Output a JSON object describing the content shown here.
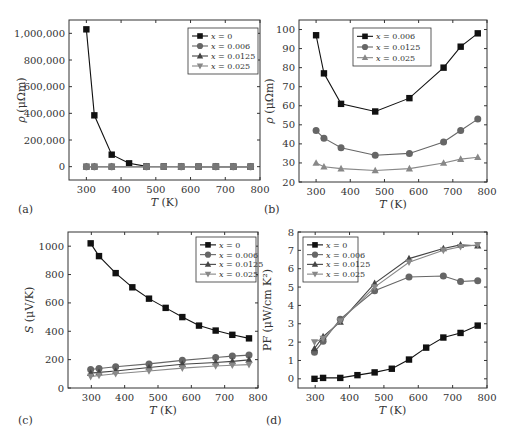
{
  "figure": {
    "panel_labels": [
      "(a)",
      "(b)",
      "(c)",
      "(d)"
    ]
  },
  "colors": {
    "x0": "#111111",
    "x006": "#666666",
    "x0125": "#444444",
    "x025": "#888888",
    "axis": "#333333"
  },
  "chart_data": [
    {
      "panel": "(a)",
      "type": "line",
      "xlabel": "T (K)",
      "ylabel": "ρ (μΩm)",
      "xlim": [
        250,
        800
      ],
      "ylim": [
        -100000,
        1100000
      ],
      "xticks": [
        300,
        400,
        500,
        600,
        700,
        800
      ],
      "yticks": [
        0,
        200000,
        400000,
        600000,
        800000,
        1000000
      ],
      "ytick_labels": [
        "0",
        "200,000",
        "400,000",
        "600,000",
        "800,000",
        "1,000,000"
      ],
      "legend_position": "upper right",
      "series": [
        {
          "name": "x = 0",
          "marker": "square",
          "x": [
            300,
            323,
            373,
            423,
            473,
            523,
            573,
            623,
            673,
            723,
            773
          ],
          "values": [
            1030000,
            385000,
            90000,
            25000,
            2000,
            1000,
            800,
            600,
            500,
            400,
            300
          ]
        },
        {
          "name": "x = 0.006",
          "marker": "circle",
          "x": [
            300,
            323,
            373,
            473,
            573,
            673,
            723,
            773
          ],
          "values": [
            97,
            77,
            61,
            57,
            64,
            80,
            91,
            98
          ]
        },
        {
          "name": "x = 0.0125",
          "marker": "triangle-up",
          "x": [
            300,
            323,
            373,
            473,
            573,
            673,
            723,
            773
          ],
          "values": [
            47,
            43,
            38,
            34,
            35,
            41,
            47,
            53
          ]
        },
        {
          "name": "x = 0.025",
          "marker": "triangle-down",
          "x": [
            300,
            323,
            373,
            473,
            573,
            673,
            723,
            773
          ],
          "values": [
            30,
            28,
            27,
            26,
            27,
            30,
            32,
            33
          ]
        }
      ]
    },
    {
      "panel": "(b)",
      "type": "line",
      "xlabel": "T (K)",
      "ylabel": "ρ (μΩm)",
      "xlim": [
        250,
        800
      ],
      "ylim": [
        20,
        105
      ],
      "xticks": [
        300,
        400,
        500,
        600,
        700,
        800
      ],
      "yticks": [
        20,
        30,
        40,
        50,
        60,
        70,
        80,
        90,
        100
      ],
      "legend_position": "upper center",
      "series": [
        {
          "name": "x = 0.006",
          "marker": "square",
          "x": [
            300,
            323,
            373,
            473,
            573,
            673,
            723,
            773
          ],
          "values": [
            97,
            77,
            61,
            57,
            64,
            80,
            91,
            98
          ]
        },
        {
          "name": "x = 0.0125",
          "marker": "circle",
          "x": [
            300,
            323,
            373,
            473,
            573,
            673,
            723,
            773
          ],
          "values": [
            47,
            43,
            38,
            34,
            35,
            41,
            47,
            53
          ]
        },
        {
          "name": "x = 0.025",
          "marker": "triangle-up",
          "x": [
            300,
            323,
            373,
            473,
            573,
            673,
            723,
            773
          ],
          "values": [
            30,
            28,
            27,
            26,
            27,
            30,
            32,
            33
          ]
        }
      ]
    },
    {
      "panel": "(c)",
      "type": "line",
      "xlabel": "T (K)",
      "ylabel": "S (μV/K)",
      "xlim": [
        230,
        800
      ],
      "ylim": [
        0,
        1100
      ],
      "xticks": [
        300,
        400,
        500,
        600,
        700,
        800
      ],
      "yticks": [
        0,
        200,
        400,
        600,
        800,
        1000
      ],
      "legend_position": "upper right",
      "series": [
        {
          "name": "x = 0",
          "marker": "square",
          "x": [
            298,
            323,
            373,
            423,
            473,
            523,
            573,
            623,
            673,
            723,
            773
          ],
          "values": [
            1020,
            930,
            810,
            710,
            630,
            565,
            500,
            440,
            405,
            375,
            350
          ]
        },
        {
          "name": "x = 0.006",
          "marker": "circle",
          "x": [
            298,
            323,
            373,
            473,
            573,
            673,
            723,
            773
          ],
          "values": [
            130,
            138,
            150,
            170,
            195,
            215,
            225,
            232
          ]
        },
        {
          "name": "x = 0.0125",
          "marker": "triangle-up",
          "x": [
            298,
            323,
            373,
            473,
            573,
            673,
            723,
            773
          ],
          "values": [
            105,
            110,
            120,
            145,
            168,
            180,
            188,
            198
          ]
        },
        {
          "name": "x = 0.025",
          "marker": "triangle-down",
          "x": [
            298,
            323,
            373,
            473,
            573,
            673,
            723,
            773
          ],
          "values": [
            80,
            88,
            100,
            120,
            140,
            155,
            160,
            165
          ]
        }
      ]
    },
    {
      "panel": "(d)",
      "type": "line",
      "xlabel": "T (K)",
      "ylabel": "PF (μW/cm K²)",
      "xlim": [
        250,
        800
      ],
      "ylim": [
        -0.5,
        8
      ],
      "xticks": [
        300,
        400,
        500,
        600,
        700,
        800
      ],
      "yticks": [
        0,
        1,
        2,
        3,
        4,
        5,
        6,
        7,
        8
      ],
      "legend_position": "upper left",
      "series": [
        {
          "name": "x = 0",
          "marker": "square",
          "x": [
            298,
            323,
            373,
            423,
            473,
            523,
            573,
            623,
            673,
            723,
            773
          ],
          "values": [
            0.0,
            0.05,
            0.05,
            0.2,
            0.35,
            0.55,
            1.05,
            1.7,
            2.25,
            2.5,
            2.9
          ]
        },
        {
          "name": "x = 0.006",
          "marker": "circle",
          "x": [
            298,
            323,
            373,
            473,
            573,
            673,
            723,
            773
          ],
          "values": [
            1.45,
            2.05,
            3.25,
            4.8,
            5.55,
            5.6,
            5.3,
            5.35
          ]
        },
        {
          "name": "x = 0.0125",
          "marker": "triangle-up",
          "x": [
            298,
            323,
            373,
            473,
            573,
            673,
            723,
            773
          ],
          "values": [
            1.65,
            2.3,
            3.1,
            5.2,
            6.55,
            7.1,
            7.3,
            7.25
          ]
        },
        {
          "name": "x = 0.025",
          "marker": "triangle-down",
          "x": [
            298,
            323,
            373,
            473,
            573,
            673,
            723,
            773
          ],
          "values": [
            2.0,
            2.2,
            3.15,
            5.0,
            6.35,
            7.0,
            7.2,
            7.3
          ]
        }
      ]
    }
  ]
}
